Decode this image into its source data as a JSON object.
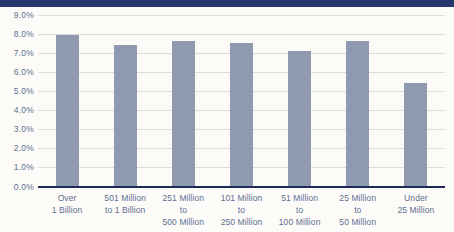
{
  "page": {
    "background_color": "#fcfbf8",
    "banner_color": "#27376b"
  },
  "chart_data": {
    "type": "bar",
    "title": "",
    "xlabel": "",
    "ylabel": "",
    "unit": "%",
    "categories": [
      "Over 1 Billion",
      "501 Million to 1 Billion",
      "251 Million to 500 Million",
      "101 Million to 250 Million",
      "51 Million to 100 Million",
      "25 Million to 50 Million",
      "Under 25 Million"
    ],
    "category_label_lines": [
      [
        "Over",
        "1 Billion"
      ],
      [
        "501 Million",
        "to 1 Billion"
      ],
      [
        "251 Million",
        "to",
        "500 Million"
      ],
      [
        "101 Million",
        "to",
        "250 Million"
      ],
      [
        "51 Million",
        "to",
        "100 Million"
      ],
      [
        "25 Million",
        "to",
        "50 Million"
      ],
      [
        "Under",
        "25 Million"
      ]
    ],
    "values": [
      7.9,
      7.4,
      7.6,
      7.5,
      7.1,
      7.6,
      5.4
    ],
    "ylim": [
      0,
      9
    ],
    "ytick_step": 1,
    "ytick_labels": [
      "0.0%",
      "1.0%",
      "2.0%",
      "3.0%",
      "4.0%",
      "5.0%",
      "6.0%",
      "7.0%",
      "8.0%",
      "9.0%"
    ],
    "grid": true,
    "legend": "none",
    "colors": {
      "bar": "#8f9ab0",
      "grid": "#dcdcdb",
      "axis": "#1d2c55",
      "tick_text": "#5d6f92"
    }
  }
}
